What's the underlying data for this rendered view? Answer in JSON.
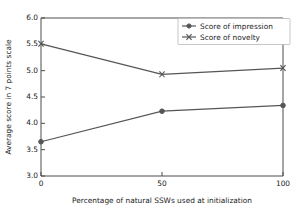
{
  "chart_data": {
    "type": "line",
    "title": "",
    "subtitle": "",
    "xlabel": "Percentage of natural SSWs used at initialization",
    "ylabel": "Average score in 7 points scale",
    "x": [
      0,
      50,
      100
    ],
    "xtick_labels": [
      "0",
      "50",
      "100"
    ],
    "ytick_labels": [
      "3.0",
      "3.5",
      "4.0",
      "4.5",
      "5.0",
      "5.5",
      "6.0"
    ],
    "ytick_values": [
      3.0,
      3.5,
      4.0,
      4.5,
      5.0,
      5.5,
      6.0
    ],
    "xlim": [
      0,
      100
    ],
    "ylim": [
      3.0,
      6.0
    ],
    "grid": false,
    "legend_position": "upper right",
    "series": [
      {
        "name": "Score of impression",
        "values": [
          3.65,
          4.23,
          4.34
        ],
        "marker": "circle",
        "color": "#555555"
      },
      {
        "name": "Score of novelty",
        "values": [
          5.51,
          4.93,
          5.05
        ],
        "marker": "x",
        "color": "#555555"
      }
    ]
  },
  "legend": {
    "entries": [
      {
        "label": "Score of impression"
      },
      {
        "label": "Score of novelty"
      }
    ]
  },
  "colors": {
    "line": "#555555",
    "axis": "#4d4d4d",
    "text": "#1a1a1a",
    "background": "#ffffff",
    "legend_border": "#b8b8b8"
  }
}
